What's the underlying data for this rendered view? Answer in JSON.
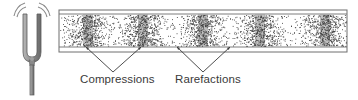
{
  "diagram": {
    "labels": {
      "compressions": "Compressions",
      "rarefactions": "Rarefactions"
    },
    "tuning_fork": {
      "icon": "tuning-fork-icon",
      "vibration_arcs": 2,
      "color": "#8a8a8a"
    },
    "tube": {
      "x": 59,
      "y": 10,
      "width": 288,
      "height": 42,
      "inner_top": 14,
      "inner_bottom": 47,
      "border_color": "#6e6e6e"
    },
    "compression_centers_x": [
      88,
      143,
      203,
      260,
      325
    ],
    "rarefaction_centers_x": [
      115,
      175,
      231,
      292
    ],
    "arrows": {
      "compressions": {
        "apex": [
          113,
          72
        ],
        "targets": [
          [
            86,
            47
          ],
          [
            141,
            47
          ]
        ]
      },
      "rarefactions": {
        "apex": [
          203,
          72
        ],
        "targets": [
          [
            177,
            47
          ],
          [
            230,
            47
          ]
        ]
      }
    },
    "colors": {
      "dots": "#3c3c3c",
      "band_shade": "#4a4a4a",
      "text": "#3a3a3a",
      "arrow": "#3a3a3a"
    }
  }
}
